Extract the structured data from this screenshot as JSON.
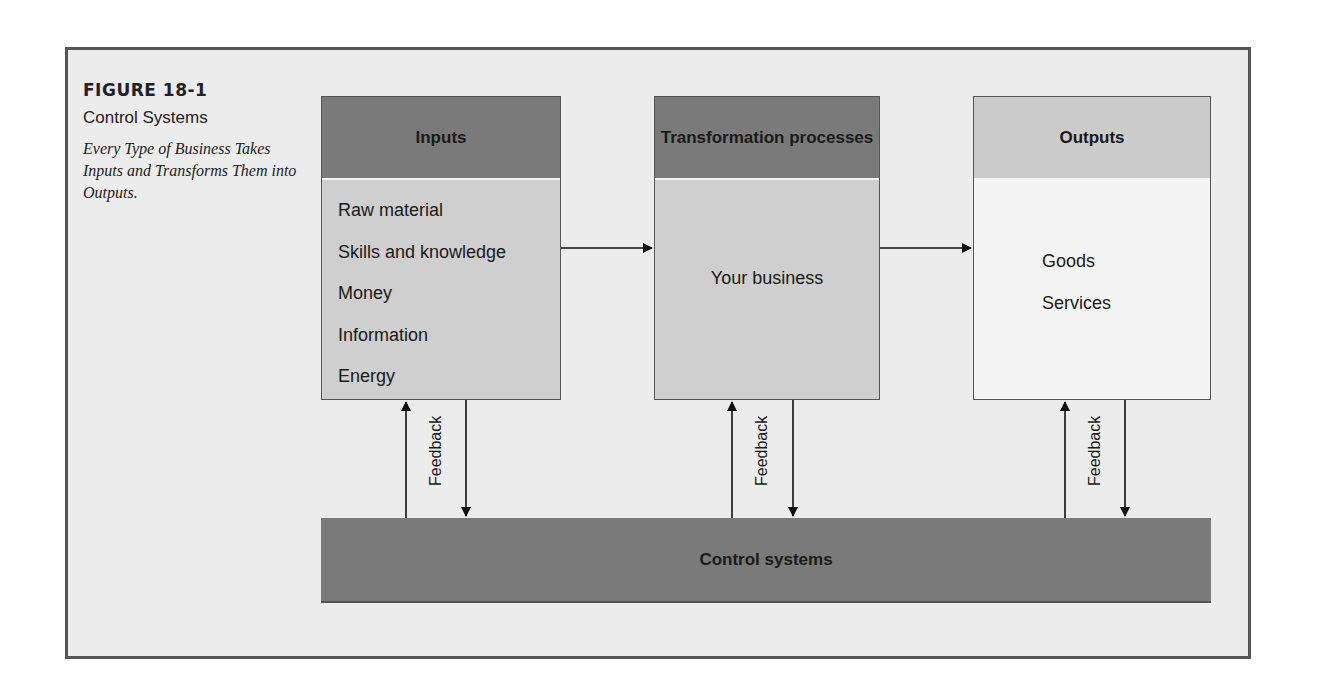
{
  "figure": {
    "number": "FIGURE 18-1",
    "title": "Control Systems",
    "caption": "Every Type of Business Takes Inputs and Transforms Them into Outputs."
  },
  "boxes": {
    "inputs": {
      "header": "Inputs",
      "items": [
        "Raw material",
        "Skills and knowledge",
        "Money",
        "Information",
        "Energy"
      ]
    },
    "transformation": {
      "header": "Transformation processes",
      "body": "Your business"
    },
    "outputs": {
      "header": "Outputs",
      "items": [
        "Goods",
        "Services"
      ]
    }
  },
  "control": {
    "label": "Control systems"
  },
  "feedback": {
    "label": "Feedback"
  },
  "colors": {
    "dark_header": "#7a7a7a",
    "mid_body": "#cfcfcf",
    "light_header": "#cbcbcb",
    "light_body": "#f4f4f4",
    "frame": "#ececec"
  }
}
